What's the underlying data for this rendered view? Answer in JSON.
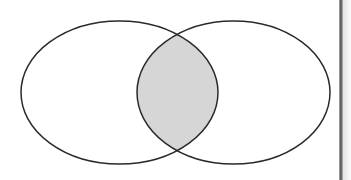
{
  "figure": {
    "kind": "venn-diagram",
    "title": "Two-set Venn diagram with the intersection shaded",
    "background_color": "#ffffff",
    "width": 351,
    "height": 180
  },
  "chart_data": {
    "type": "diagram",
    "subtype": "venn",
    "title": "",
    "set_count": 2,
    "shaded_region": "intersection",
    "shaded_region_label": "",
    "sets": [
      {
        "name": "left-set",
        "label": "",
        "shape": "ellipse",
        "center_x": 119.5,
        "center_y": 92.5,
        "radius_x": 98.5,
        "radius_y": 71.5,
        "fill": "none",
        "stroke": "#2a2a2a",
        "stroke_width": 1.5
      },
      {
        "name": "right-set",
        "label": "",
        "shape": "ellipse",
        "center_x": 233.5,
        "center_y": 92.5,
        "radius_x": 96.5,
        "radius_y": 71.5,
        "fill": "none",
        "stroke": "#2a2a2a",
        "stroke_width": 1.5
      }
    ],
    "intersection": {
      "name": "lens",
      "fill": "#d6d6d6",
      "stroke": "#2a2a2a",
      "stroke_width": 1.5,
      "left_x": 137,
      "right_x": 218,
      "top_crossing_x": 178,
      "top_crossing_y": 32,
      "bottom_crossing_x": 178,
      "bottom_crossing_y": 152
    },
    "labels": [],
    "annotations": [],
    "legend": null,
    "grid": false
  },
  "page_edge": {
    "name": "scanned-page-edge",
    "rule_color": "#5d5d5d",
    "band_color": "#e2e2e2",
    "x": 339,
    "width": 12
  }
}
